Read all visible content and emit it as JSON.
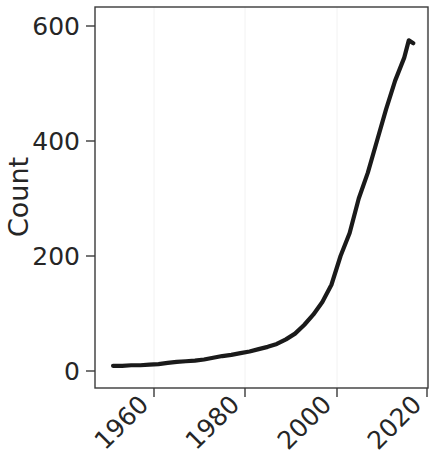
{
  "chart_data": {
    "type": "line",
    "title": "",
    "subtitle": "",
    "xlabel": "",
    "ylabel": "Count",
    "xlim": [
      1951,
      2018
    ],
    "ylim": [
      0,
      620
    ],
    "grid": "faint vertical gridlines at x ticks",
    "legend": "none",
    "legend_position": "none",
    "line_color": "#1a1a1a",
    "axis_color": "#3a3a3a",
    "text_color": "#262626",
    "background_color": "#ffffff",
    "xticks": [
      1960,
      1980,
      2000,
      2020
    ],
    "xtick_labels": [
      "1960",
      "1980",
      "2000",
      "2020"
    ],
    "xtick_rotation_deg": 45,
    "yticks": [
      0,
      200,
      400,
      600
    ],
    "ytick_labels": [
      "0",
      "200",
      "400",
      "600"
    ],
    "series": [
      {
        "name": "Count",
        "x": [
          1951,
          1953,
          1955,
          1957,
          1959,
          1961,
          1963,
          1965,
          1967,
          1969,
          1971,
          1973,
          1975,
          1977,
          1979,
          1981,
          1983,
          1985,
          1987,
          1989,
          1991,
          1993,
          1995,
          1997,
          1999,
          2001,
          2003,
          2005,
          2007,
          2009,
          2011,
          2013,
          2015,
          2016,
          2017
        ],
        "values": [
          9,
          9,
          10,
          10,
          11,
          12,
          14,
          16,
          17,
          18,
          20,
          23,
          26,
          28,
          31,
          34,
          38,
          42,
          47,
          55,
          65,
          80,
          98,
          120,
          150,
          200,
          240,
          300,
          345,
          400,
          455,
          505,
          545,
          575,
          570
        ]
      }
    ]
  },
  "figure": {
    "y_axis_title": "Count",
    "x_tick_1": "1960",
    "x_tick_2": "1980",
    "x_tick_3": "2000",
    "x_tick_4": "2020",
    "y_tick_1": "0",
    "y_tick_2": "200",
    "y_tick_3": "400",
    "y_tick_4": "600"
  }
}
